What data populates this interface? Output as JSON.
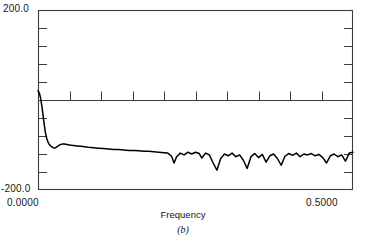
{
  "chart_data": {
    "type": "line",
    "title": "",
    "caption": "(b)",
    "xlabel": "Frequency",
    "ylabel": "",
    "xlim": [
      0.0,
      0.5
    ],
    "ylim": [
      -200.0,
      200.0
    ],
    "xtick_labels": [
      "0.0000",
      "0.5000"
    ],
    "ytick_labels": [
      "200.0",
      "-200.0"
    ],
    "grid": false,
    "legend": null,
    "axis_style": "box-frame-with-inward-ticks",
    "zero_line": 0.0,
    "y_minor_tick_interval": 40.0,
    "x_minor_tick_interval": 0.05,
    "x_minor_ticks_on_zero_line": true,
    "line_color": "#000000",
    "frame_color": "#3c3c3c",
    "series": [
      {
        "name": "spectrum",
        "x": [
          0.0,
          0.002,
          0.004,
          0.006,
          0.008,
          0.01,
          0.012,
          0.014,
          0.016,
          0.018,
          0.02,
          0.022,
          0.024,
          0.026,
          0.028,
          0.03,
          0.034,
          0.038,
          0.042,
          0.046,
          0.05,
          0.056,
          0.062,
          0.068,
          0.074,
          0.08,
          0.088,
          0.096,
          0.104,
          0.112,
          0.12,
          0.128,
          0.136,
          0.144,
          0.152,
          0.16,
          0.168,
          0.176,
          0.184,
          0.192,
          0.2,
          0.206,
          0.212,
          0.216,
          0.22,
          0.226,
          0.232,
          0.238,
          0.244,
          0.25,
          0.256,
          0.26,
          0.266,
          0.272,
          0.278,
          0.284,
          0.29,
          0.296,
          0.302,
          0.308,
          0.314,
          0.32,
          0.326,
          0.332,
          0.338,
          0.344,
          0.35,
          0.356,
          0.362,
          0.368,
          0.374,
          0.38,
          0.386,
          0.392,
          0.398,
          0.404,
          0.41,
          0.416,
          0.422,
          0.428,
          0.434,
          0.44,
          0.446,
          0.452,
          0.458,
          0.464,
          0.47,
          0.476,
          0.482,
          0.488,
          0.494,
          0.5
        ],
        "y": [
          21.0,
          16.0,
          5.0,
          -12.0,
          -34.0,
          -56.0,
          -74.0,
          -86.0,
          -94.0,
          -99.0,
          -102.0,
          -104.0,
          -106.0,
          -107.0,
          -106.0,
          -104.0,
          -100.0,
          -98.0,
          -98.0,
          -99.0,
          -100.0,
          -101.0,
          -102.0,
          -103.0,
          -104.0,
          -105.0,
          -106.0,
          -107.0,
          -108.0,
          -109.0,
          -110.0,
          -110.0,
          -111.0,
          -112.0,
          -112.0,
          -113.0,
          -114.0,
          -114.0,
          -115.0,
          -116.0,
          -117.0,
          -118.0,
          -125.0,
          -140.0,
          -126.0,
          -118.0,
          -122.0,
          -116.0,
          -120.0,
          -116.0,
          -119.0,
          -129.0,
          -118.0,
          -122.0,
          -140.0,
          -156.0,
          -130.0,
          -120.0,
          -124.0,
          -118.0,
          -126.0,
          -122.0,
          -134.0,
          -152.0,
          -126.0,
          -119.0,
          -128.0,
          -121.0,
          -138.0,
          -124.0,
          -120.0,
          -130.0,
          -145.0,
          -125.0,
          -119.0,
          -123.0,
          -118.0,
          -126.0,
          -120.0,
          -122.0,
          -119.0,
          -124.0,
          -121.0,
          -128.0,
          -140.0,
          -124.0,
          -120.0,
          -126.0,
          -122.0,
          -136.0,
          -118.0,
          -116.0
        ]
      }
    ]
  }
}
